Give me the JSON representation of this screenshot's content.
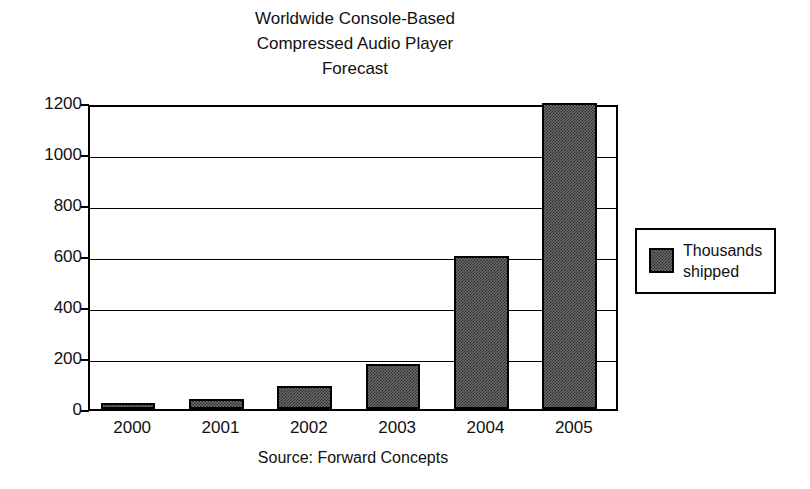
{
  "chart_data": {
    "type": "bar",
    "title": "Worldwide Console-Based\nCompressed Audio Player\nForecast",
    "title_lines": [
      "Worldwide Console-Based",
      "Compressed Audio Player",
      "Forecast"
    ],
    "categories": [
      "2000",
      "2001",
      "2002",
      "2003",
      "2004",
      "2005"
    ],
    "values": [
      25,
      40,
      90,
      175,
      600,
      1200
    ],
    "series": [
      {
        "name": "Thousands shipped",
        "values": [
          25,
          40,
          90,
          175,
          600,
          1200
        ]
      }
    ],
    "xlabel": "",
    "ylabel": "",
    "ylim": [
      0,
      1200
    ],
    "yticks": [
      0,
      200,
      400,
      600,
      800,
      1000,
      1200
    ],
    "ytick_labels": [
      "0",
      "200",
      "400",
      "600",
      "800",
      "1000",
      "1200"
    ],
    "grid": true,
    "grid_axis": "y",
    "legend": {
      "position": "right",
      "entries": [
        "Thousands shipped"
      ],
      "label_lines": [
        "Thousands",
        "shipped"
      ]
    },
    "annotations": [
      "Source: Forward Concepts"
    ],
    "source_note": "Source: Forward Concepts",
    "colors": {
      "bar_fill": "#6b6b6b",
      "bar_outline": "#000000",
      "axis": "#000000",
      "grid": "#000000",
      "background": "#ffffff",
      "text": "#111111"
    }
  }
}
